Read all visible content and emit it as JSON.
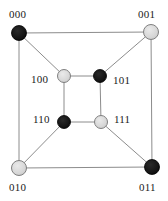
{
  "figure": {
    "name": "3-bit-hypercube-graph",
    "width": 168,
    "height": 201,
    "background": "#ffffff"
  },
  "style": {
    "edge_color": "#8c8c8c",
    "edge_width": 1,
    "node_black_fill": "#141414",
    "node_black_stroke": "#000000",
    "node_light_fill": "#d6d6d6",
    "node_light_stroke": "#808080",
    "label_color": "#1a1a1a",
    "label_font_size": 11
  },
  "nodes": [
    {
      "id": "000",
      "label": "000",
      "color": "black",
      "cx": 19,
      "cy": 33,
      "r": 7.5,
      "label_x": 9,
      "label_y": 9,
      "label_anchor": "above-left"
    },
    {
      "id": "001",
      "label": "001",
      "color": "light",
      "cx": 151,
      "cy": 32,
      "r": 7.5,
      "label_x": 138,
      "label_y": 9,
      "label_anchor": "above-right"
    },
    {
      "id": "010",
      "label": "010",
      "color": "light",
      "cx": 19,
      "cy": 168,
      "r": 7.5,
      "label_x": 9,
      "label_y": 182,
      "label_anchor": "below-left"
    },
    {
      "id": "011",
      "label": "011",
      "color": "black",
      "cx": 152,
      "cy": 167,
      "r": 7.5,
      "label_x": 139,
      "label_y": 182,
      "label_anchor": "below-right"
    },
    {
      "id": "100",
      "label": "100",
      "color": "light",
      "cx": 64,
      "cy": 76,
      "r": 6.5,
      "label_x": 31,
      "label_y": 74,
      "label_anchor": "left"
    },
    {
      "id": "101",
      "label": "101",
      "color": "black",
      "cx": 100,
      "cy": 76,
      "r": 6.5,
      "label_x": 113,
      "label_y": 75,
      "label_anchor": "right"
    },
    {
      "id": "110",
      "label": "110",
      "color": "black",
      "cx": 64,
      "cy": 122,
      "r": 6.5,
      "label_x": 33,
      "label_y": 114,
      "label_anchor": "left"
    },
    {
      "id": "111",
      "label": "111",
      "color": "light",
      "cx": 101,
      "cy": 122,
      "r": 6.5,
      "label_x": 114,
      "label_y": 114,
      "label_anchor": "right"
    }
  ],
  "edges": [
    {
      "from": "000",
      "to": "001",
      "kind": "outer-top"
    },
    {
      "from": "001",
      "to": "011",
      "kind": "outer-right"
    },
    {
      "from": "011",
      "to": "010",
      "kind": "outer-bottom"
    },
    {
      "from": "010",
      "to": "000",
      "kind": "outer-left"
    },
    {
      "from": "100",
      "to": "101",
      "kind": "inner-top"
    },
    {
      "from": "101",
      "to": "111",
      "kind": "inner-right"
    },
    {
      "from": "111",
      "to": "110",
      "kind": "inner-bottom"
    },
    {
      "from": "110",
      "to": "100",
      "kind": "inner-left"
    },
    {
      "from": "000",
      "to": "100",
      "kind": "diagonal"
    },
    {
      "from": "001",
      "to": "101",
      "kind": "diagonal"
    },
    {
      "from": "010",
      "to": "110",
      "kind": "diagonal"
    },
    {
      "from": "011",
      "to": "111",
      "kind": "diagonal"
    }
  ]
}
